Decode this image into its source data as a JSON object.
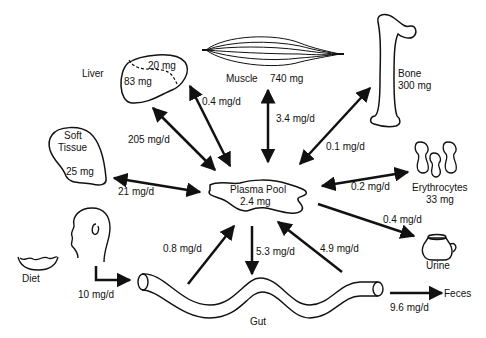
{
  "nodes": {
    "liver": {
      "label": "Liver",
      "value_a": "20 mg",
      "value_b": "83 mg"
    },
    "muscle": {
      "label": "Muscle",
      "value": "740 mg"
    },
    "bone": {
      "label": "Bone",
      "value": "300 mg"
    },
    "soft_tissue": {
      "label_1": "Soft",
      "label_2": "Tissue",
      "value": "25 mg"
    },
    "plasma_pool": {
      "label": "Plasma Pool",
      "value": "2.4 mg"
    },
    "erythrocytes": {
      "label": "Erythrocytes",
      "value": "33 mg"
    },
    "urine": {
      "label": "Urine"
    },
    "diet": {
      "label": "Diet"
    },
    "gut": {
      "label": "Gut"
    },
    "feces": {
      "label": "Feces"
    }
  },
  "fluxes": {
    "liver_outer": "205 mg/d",
    "liver_inner": "0.4 mg/d",
    "muscle": "3.4 mg/d",
    "bone": "0.1 mg/d",
    "soft_tissue": "21 mg/d",
    "erythrocytes": "0.2 mg/d",
    "urine": "0.4 mg/d",
    "diet": "10 mg/d",
    "gut_to_plasma": "0.8 mg/d",
    "plasma_to_gut": "5.3 mg/d",
    "gut_to_plasma_2": "4.9 mg/d",
    "feces": "9.6 mg/d"
  }
}
